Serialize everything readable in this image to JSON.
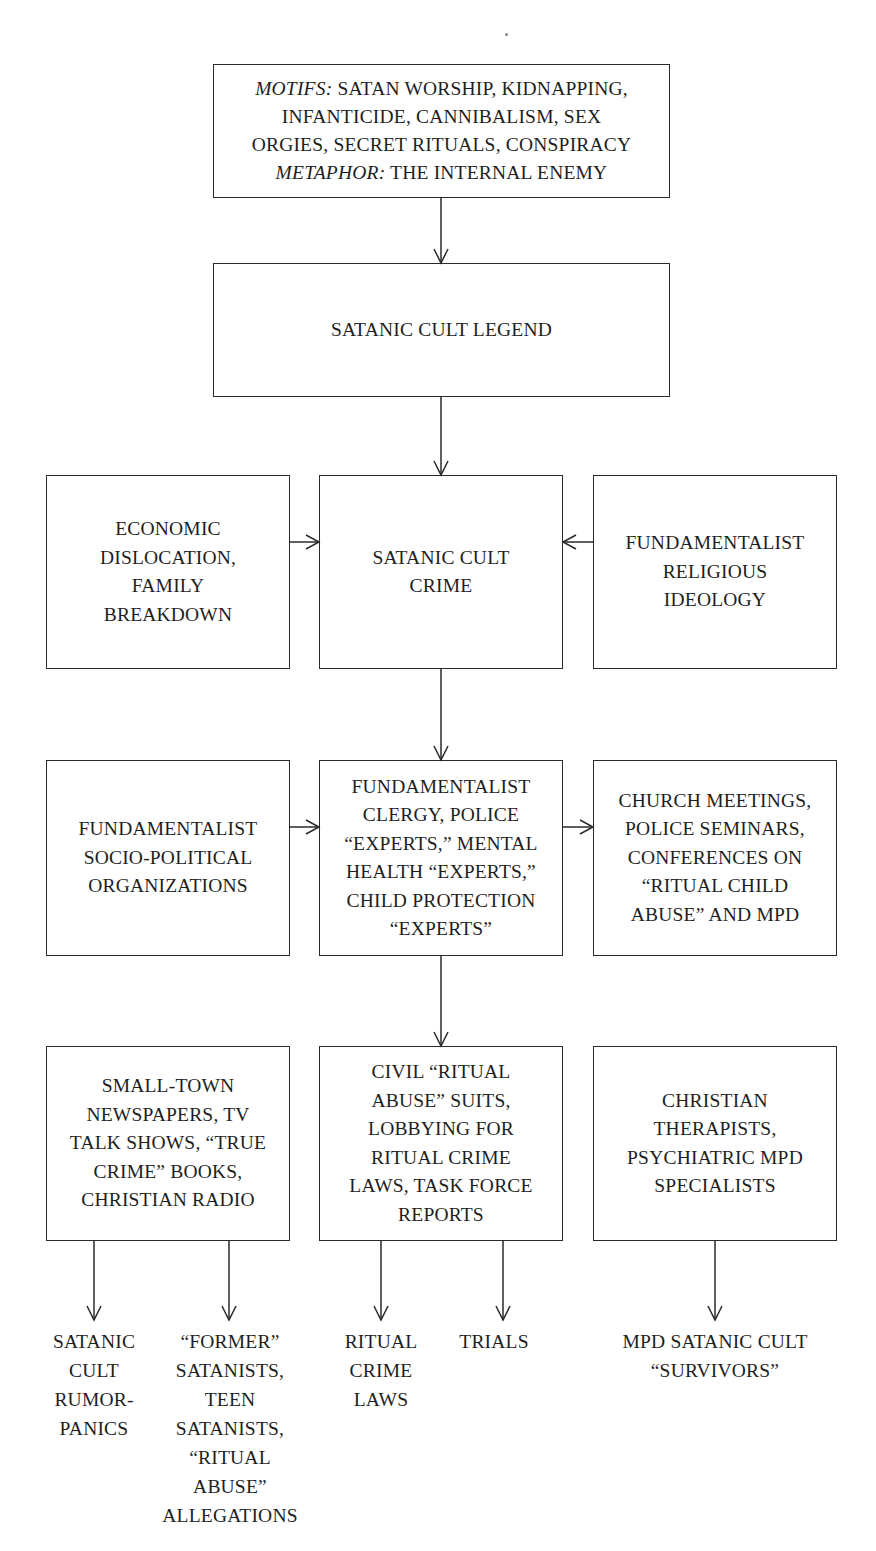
{
  "diagram": {
    "top": {
      "motifs_label": "MOTIFS:",
      "motifs_text_line1": " SATAN WORSHIP, KIDNAPPING,",
      "motifs_text_line2": "INFANTICIDE, CANNIBALISM, SEX",
      "motifs_text_line3": "ORGIES, SECRET RITUALS, CONSPIRACY",
      "metaphor_label": "METAPHOR:",
      "metaphor_text": " THE INTERNAL ENEMY"
    },
    "legend": {
      "text": "SATANIC CULT LEGEND"
    },
    "row2": {
      "left": "ECONOMIC\nDISLOCATION,\nFAMILY\nBREAKDOWN",
      "center": "SATANIC CULT\nCRIME",
      "right": "FUNDAMENTALIST\nRELIGIOUS\nIDEOLOGY"
    },
    "row3": {
      "left": "FUNDAMENTALIST\nSOCIO-POLITICAL\nORGANIZATIONS",
      "center": "FUNDAMENTALIST\nCLERGY, POLICE\n“EXPERTS,” MENTAL\nHEALTH “EXPERTS,”\nCHILD PROTECTION\n“EXPERTS”",
      "right": "CHURCH MEETINGS,\nPOLICE SEMINARS,\nCONFERENCES ON\n“RITUAL CHILD\nABUSE” AND MPD"
    },
    "row4": {
      "left": "SMALL-TOWN\nNEWSPAPERS, TV\nTALK SHOWS, “TRUE\nCRIME” BOOKS,\nCHRISTIAN RADIO",
      "center": "CIVIL “RITUAL\nABUSE” SUITS,\nLOBBYING FOR\nRITUAL CRIME\nLAWS, TASK FORCE\nREPORTS",
      "right": "CHRISTIAN\nTHERAPISTS,\nPSYCHIATRIC MPD\nSPECIALISTS"
    },
    "outcomes": [
      {
        "text": "SATANIC\nCULT\nRUMOR-\nPANICS"
      },
      {
        "text": "“FORMER”\nSATANISTS,\nTEEN\nSATANISTS,\n“RITUAL\nABUSE”\nALLEGATIONS"
      },
      {
        "text": "RITUAL\nCRIME\nLAWS"
      },
      {
        "text": "TRIALS"
      },
      {
        "text": "MPD SATANIC CULT\n“SURVIVORS”"
      }
    ],
    "colors": {
      "line": "#2a2a2a",
      "text": "#1e1e1e",
      "background": "#ffffff"
    }
  }
}
